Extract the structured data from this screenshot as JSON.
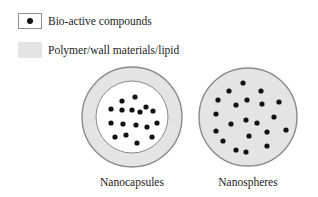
{
  "legend": [
    {
      "label": "Bio-active compounds",
      "swatch": "dot"
    },
    {
      "label": "Polymer/wall materials/lipid",
      "swatch": "fill"
    }
  ],
  "colors": {
    "shell_fill": "#e4e4e4",
    "shell_stroke": "#8a8a8a",
    "core_fill": "#ffffff",
    "dot": "#111111"
  },
  "particles": [
    {
      "label": "Nanocapsules",
      "type": "capsule",
      "cx": 132,
      "cy": 117,
      "r": 50,
      "core_r": 36,
      "dots": [
        [
          135,
          97
        ],
        [
          122,
          101
        ],
        [
          111,
          109
        ],
        [
          122,
          110
        ],
        [
          132,
          110
        ],
        [
          140,
          112
        ],
        [
          146,
          107
        ],
        [
          153,
          111
        ],
        [
          111,
          123
        ],
        [
          123,
          124
        ],
        [
          136,
          125
        ],
        [
          147,
          127
        ],
        [
          157,
          123
        ],
        [
          115,
          137
        ],
        [
          126,
          135
        ],
        [
          137,
          143
        ],
        [
          152,
          137
        ]
      ]
    },
    {
      "label": "Nanospheres",
      "type": "sphere",
      "cx": 248,
      "cy": 117,
      "r": 49,
      "dots": [
        [
          243,
          83
        ],
        [
          229,
          91
        ],
        [
          261,
          91
        ],
        [
          218,
          100
        ],
        [
          247,
          100
        ],
        [
          236,
          105
        ],
        [
          262,
          104
        ],
        [
          279,
          102
        ],
        [
          216,
          114
        ],
        [
          274,
          117
        ],
        [
          246,
          120
        ],
        [
          257,
          123
        ],
        [
          231,
          124
        ],
        [
          216,
          131
        ],
        [
          267,
          132
        ],
        [
          286,
          130
        ],
        [
          249,
          136
        ],
        [
          223,
          141
        ],
        [
          267,
          146
        ],
        [
          236,
          150
        ],
        [
          246,
          152
        ]
      ]
    }
  ]
}
